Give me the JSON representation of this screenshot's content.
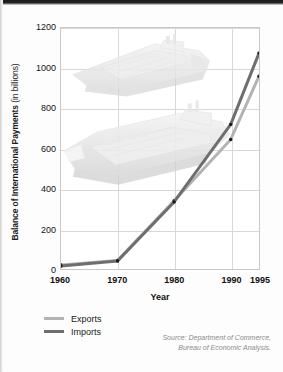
{
  "chart_data": {
    "type": "line",
    "title": "",
    "xlabel": "Year",
    "ylabel": "Balance of International Payments (in billions)",
    "ylabel_bold": "Balance of International Payments",
    "ylabel_light": "(in billions)",
    "x": [
      1960,
      1970,
      1980,
      1990,
      1995
    ],
    "xtick_labels": [
      "1960",
      "1970",
      "1980",
      "1990",
      "1995"
    ],
    "ytick_labels": [
      "0",
      "200",
      "400",
      "600",
      "800",
      "1000",
      "1200"
    ],
    "yticks": [
      0,
      200,
      400,
      600,
      800,
      1000,
      1200
    ],
    "ylim": [
      0,
      1200
    ],
    "xlim": [
      1960,
      1995
    ],
    "grid": true,
    "legend_position": "below-left",
    "series": [
      {
        "name": "Exports",
        "color": "#b3b3b3",
        "values": [
          20,
          43,
          340,
          645,
          960
        ]
      },
      {
        "name": "Imports",
        "color": "#6e6e6e",
        "values": [
          15,
          40,
          334,
          720,
          1075
        ]
      }
    ],
    "annotations": [
      "Source: Department of Commerce,",
      "Bureau of Economic Analysis."
    ],
    "watermarks": [
      "cargo-ship-upper",
      "cargo-ship-lower"
    ]
  },
  "axis": {
    "y_title_bold": "Balance of International Payments",
    "y_title_light": " (in billions)",
    "x_title": "Year",
    "y_ticks": [
      "1200",
      "1000",
      "800",
      "600",
      "400",
      "200",
      "0"
    ],
    "x_ticks": [
      "1960",
      "1970",
      "1980",
      "1990",
      "1995"
    ]
  },
  "legend": {
    "items": [
      {
        "label": "Exports",
        "color": "#b3b3b3"
      },
      {
        "label": "Imports",
        "color": "#6e6e6e"
      }
    ]
  },
  "source": {
    "line1": "Source: Department of Commerce,",
    "line2": "Bureau of Economic Analysis."
  }
}
